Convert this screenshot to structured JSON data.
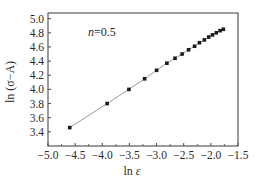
{
  "chart_data": {
    "type": "scatter",
    "title": "",
    "xlabel": "ln ε",
    "ylabel": "ln (σ−A)",
    "xlim": [
      -5.0,
      -1.5
    ],
    "ylim": [
      3.3,
      5.05
    ],
    "xticks": [
      -5.0,
      -4.5,
      -4.0,
      -3.5,
      -3.0,
      -2.5,
      -2.0,
      -1.5
    ],
    "xtick_labels": [
      "−5.0",
      "−4.5",
      "−4.0",
      "−3.5",
      "−3.0",
      "−2.5",
      "−2.0",
      "−1.5"
    ],
    "yticks": [
      3.4,
      3.6,
      3.8,
      4.0,
      4.2,
      4.4,
      4.6,
      4.8,
      5.0
    ],
    "ytick_labels": [
      "3.4",
      "3.6",
      "3.8",
      "4.0",
      "4.2",
      "4.4",
      "4.6",
      "4.8",
      "5.0"
    ],
    "grid": false,
    "legend": null,
    "annotations": [
      {
        "text": "n=0.5",
        "x": -3.7,
        "y": 4.78
      }
    ],
    "series": [
      {
        "name": "n=0.5",
        "marker": "square",
        "line": "fitted straight line",
        "x": [
          -4.6,
          -3.91,
          -3.51,
          -3.22,
          -3.0,
          -2.81,
          -2.66,
          -2.53,
          -2.41,
          -2.3,
          -2.21,
          -2.12,
          -2.04,
          -1.97,
          -1.9,
          -1.83,
          -1.77
        ],
        "y": [
          3.46,
          3.8,
          4.0,
          4.15,
          4.27,
          4.37,
          4.44,
          4.5,
          4.56,
          4.61,
          4.66,
          4.7,
          4.74,
          4.77,
          4.8,
          4.83,
          4.85
        ]
      }
    ]
  },
  "colors": {
    "frame": "#4a4a4a",
    "line": "#9a9a9a",
    "marker": "#1a1a1a",
    "text": "#2a2a2a"
  },
  "labels": {
    "annotation_n": "n",
    "annotation_value": "=0.5",
    "xlabel_ln": "ln ",
    "xlabel_var": "ε",
    "ylabel": "ln (σ−A)"
  }
}
